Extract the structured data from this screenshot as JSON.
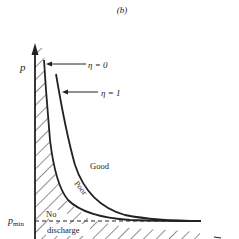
{
  "figure": {
    "panel_label": "(b)",
    "y_axis_label": "p",
    "p_min_label_main": "p",
    "p_min_label_sub": "min",
    "curves": [
      {
        "id": "eta0",
        "label": "η = 0"
      },
      {
        "id": "eta1",
        "label": "η = 1"
      }
    ],
    "regions": {
      "good": "Good",
      "poor": "Poor",
      "no_discharge_line1": "No",
      "no_discharge_line2": "discharge"
    },
    "colors": {
      "ink": "#222222",
      "background": "#ffffff"
    }
  }
}
